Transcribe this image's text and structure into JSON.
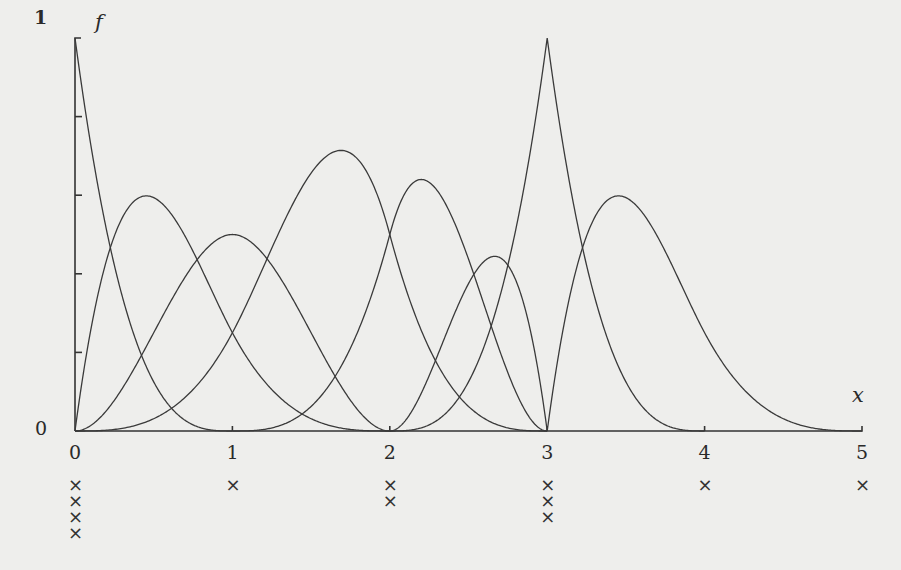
{
  "chart_data": {
    "type": "line",
    "title": "",
    "xlabel": "x",
    "ylabel": "f",
    "xlim": [
      0,
      5
    ],
    "ylim": [
      0,
      1
    ],
    "grid": false,
    "legend": null,
    "degree": 3,
    "knots": [
      0,
      0,
      0,
      0,
      1,
      2,
      2,
      3,
      3,
      3,
      4,
      5
    ],
    "knot_markers": [
      {
        "x": 0,
        "multiplicity": 4
      },
      {
        "x": 1,
        "multiplicity": 1
      },
      {
        "x": 2,
        "multiplicity": 2
      },
      {
        "x": 3,
        "multiplicity": 3
      },
      {
        "x": 4,
        "multiplicity": 1
      },
      {
        "x": 5,
        "multiplicity": 1
      }
    ],
    "x_ticks": [
      "0",
      "1",
      "2",
      "3",
      "4",
      "5"
    ],
    "y_tick_labels": [
      "0",
      "1"
    ],
    "y_minor_ticks": [
      0.2,
      0.4,
      0.6,
      0.8
    ],
    "series": [
      {
        "name": "B0",
        "support": [
          0,
          1
        ],
        "peak": {
          "x": 0.0,
          "y": 1.0
        }
      },
      {
        "name": "B1",
        "support": [
          0,
          2
        ],
        "peak": {
          "x": 0.45,
          "y": 0.59
        }
      },
      {
        "name": "B2",
        "support": [
          0,
          2
        ],
        "peak": {
          "x": 1.0,
          "y": 0.5
        }
      },
      {
        "name": "B3",
        "support": [
          0,
          3
        ],
        "peak": {
          "x": 1.68,
          "y": 0.72
        }
      },
      {
        "name": "B4",
        "support": [
          1,
          3
        ],
        "peak": {
          "x": 2.2,
          "y": 0.65
        }
      },
      {
        "name": "B5",
        "support": [
          2,
          3
        ],
        "peak": {
          "x": 2.67,
          "y": 0.44
        }
      },
      {
        "name": "B6",
        "support": [
          2,
          4
        ],
        "peak": {
          "x": 3.0,
          "y": 1.0
        }
      },
      {
        "name": "B7",
        "support": [
          3,
          5
        ],
        "peak": {
          "x": 3.47,
          "y": 0.61
        }
      }
    ]
  },
  "labels": {
    "y_top": "1",
    "y_bottom": "0",
    "y_axis_name": "f",
    "x_axis_name": "x",
    "x_ticks": [
      "0",
      "1",
      "2",
      "3",
      "4",
      "5"
    ],
    "knot_symbol": "×"
  }
}
